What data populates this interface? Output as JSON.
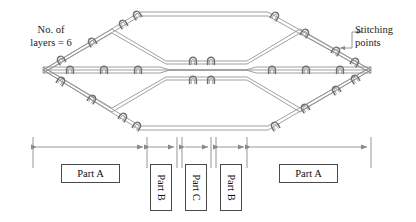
{
  "figure": {
    "type": "technical-diagram"
  },
  "annotations": {
    "layers_note": "No. of\nlayers = 6",
    "layers_count": 6,
    "stitching_note": "Stitching\npoints"
  },
  "parts": [
    {
      "id": "partA-left",
      "label": "Part A",
      "orientation": "horizontal",
      "x": 33,
      "width": 114
    },
    {
      "id": "partB-left",
      "label": "Part B",
      "orientation": "vertical",
      "x": 147,
      "width": 30
    },
    {
      "id": "partC",
      "label": "Part C",
      "orientation": "vertical",
      "x": 182,
      "width": 29
    },
    {
      "id": "partB-right",
      "label": "Part B",
      "orientation": "vertical",
      "x": 216,
      "width": 31
    },
    {
      "id": "partA-right",
      "label": "Part A",
      "orientation": "horizontal",
      "x": 247,
      "width": 124
    }
  ],
  "dimension_line": {
    "y": 147,
    "ticks": [
      33,
      147,
      177,
      182,
      211,
      216,
      247,
      371
    ],
    "segments": [
      {
        "from": 33,
        "to": 147,
        "part": "Part A"
      },
      {
        "from": 147,
        "to": 177,
        "part": "Part B"
      },
      {
        "from": 182,
        "to": 211,
        "part": "Part C"
      },
      {
        "from": 216,
        "to": 247,
        "part": "Part B"
      },
      {
        "from": 247,
        "to": 371,
        "part": "Part A"
      }
    ]
  },
  "colors": {
    "line": "#8c8c8c",
    "stitch": "#7a7a7a",
    "dimension": "#8a8a8a",
    "text": "#1b1b1b",
    "box_border": "#4a4a4a",
    "background": "#ffffff"
  },
  "geometry": {
    "left_tip_x": 43,
    "right_tip_x": 371,
    "center_y": 70,
    "outer_top_y": 12,
    "outer_bottom_y": 130,
    "mid_top_y": 46,
    "mid_bottom_y": 95,
    "plateau_left_x": 155,
    "plateau_right_x": 258
  }
}
